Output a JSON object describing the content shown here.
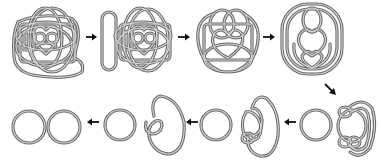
{
  "diagram": {
    "title": "",
    "description": "Sequence of knot diagrams being simplified step by step into two separate unknotted circles",
    "colors": {
      "background": "#ffffff",
      "tube_edge": "#6a6a6a",
      "tube_core": "#d8d8d8",
      "arrow": "#111111"
    },
    "steps": [
      {
        "id": "step-1",
        "label": "complex knot with outer loop",
        "row": 1,
        "order": 1
      },
      {
        "id": "step-2",
        "label": "separated long loop and knot",
        "row": 1,
        "order": 2
      },
      {
        "id": "step-3",
        "label": "reduced knot",
        "row": 1,
        "order": 3
      },
      {
        "id": "step-4",
        "label": "nested loops knot",
        "row": 1,
        "order": 4
      },
      {
        "id": "step-5",
        "label": "circle plus triple-loop knot",
        "row": 2,
        "order": 5
      },
      {
        "id": "step-6",
        "label": "circle plus double-loop knot",
        "row": 2,
        "order": 6
      },
      {
        "id": "step-7",
        "label": "circle plus single twisted loop",
        "row": 2,
        "order": 7
      },
      {
        "id": "step-8",
        "label": "two unlinked circles",
        "row": 2,
        "order": 8
      }
    ],
    "arrows": [
      {
        "id": "arrow-1-2",
        "direction": "right",
        "x1": 86,
        "y1": 37,
        "x2": 97,
        "y2": 37
      },
      {
        "id": "arrow-2-3",
        "direction": "right",
        "x1": 178,
        "y1": 37,
        "x2": 190,
        "y2": 37
      },
      {
        "id": "arrow-3-4",
        "direction": "right",
        "x1": 263,
        "y1": 37,
        "x2": 275,
        "y2": 37
      },
      {
        "id": "arrow-4-5",
        "direction": "down-right",
        "x1": 326,
        "y1": 84,
        "x2": 335,
        "y2": 94
      },
      {
        "id": "arrow-5-6",
        "direction": "left",
        "x1": 296,
        "y1": 122,
        "x2": 283,
        "y2": 122
      },
      {
        "id": "arrow-6-7",
        "direction": "left",
        "x1": 198,
        "y1": 122,
        "x2": 186,
        "y2": 122
      },
      {
        "id": "arrow-7-8",
        "direction": "left",
        "x1": 99,
        "y1": 122,
        "x2": 86,
        "y2": 122
      }
    ]
  }
}
